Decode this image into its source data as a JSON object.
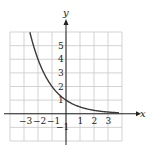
{
  "chart_data": {
    "type": "line",
    "title": "",
    "xlabel": "x",
    "ylabel": "y",
    "xlim": [
      -4,
      4
    ],
    "ylim": [
      -2,
      6
    ],
    "grid": true,
    "x_ticks": [
      -3,
      -2,
      -1,
      1,
      2,
      3
    ],
    "x_tick_labels": [
      "−3",
      "−2",
      "−1",
      "1",
      "2",
      "3"
    ],
    "y_ticks": [
      -1,
      1,
      2,
      3,
      4,
      5
    ],
    "y_tick_labels": [
      "−1",
      "1",
      "2",
      "3",
      "4",
      "5"
    ],
    "series": [
      {
        "name": "y = (1/2)^x",
        "function": "2^(-x)",
        "x": [
          -2.58,
          -2,
          -1,
          0,
          1,
          2,
          3,
          4
        ],
        "values": [
          6.0,
          4.0,
          2.0,
          1.0,
          0.5,
          0.25,
          0.125,
          0.0625
        ]
      }
    ],
    "colors": {
      "curve": "#3a3a3a",
      "grid": "#c8c8c8",
      "axis": "#222222"
    }
  },
  "labels": {
    "x_axis": "x",
    "y_axis": "y"
  }
}
